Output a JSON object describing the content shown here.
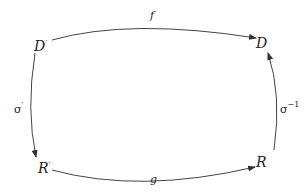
{
  "diagram": {
    "type": "commutative-square",
    "nodes": {
      "top_left": {
        "base": "D",
        "sup": "′"
      },
      "top_right": {
        "base": "D",
        "sup": ""
      },
      "bottom_left": {
        "base": "R",
        "sup": "′"
      },
      "bottom_right": {
        "base": "R",
        "sup": ""
      }
    },
    "arrows": {
      "top": {
        "from": "D′",
        "to": "D",
        "label": "f",
        "sup": ""
      },
      "left": {
        "from": "D′",
        "to": "R′",
        "label": "σ",
        "sup": "′"
      },
      "right": {
        "from": "R",
        "to": "D",
        "label": "σ",
        "sup": "−1"
      },
      "bottom": {
        "from": "R′",
        "to": "R",
        "label": "g",
        "sup": ""
      }
    },
    "colors": {
      "stroke": "#333333",
      "text": "#222222",
      "background": "#ffffff"
    }
  }
}
